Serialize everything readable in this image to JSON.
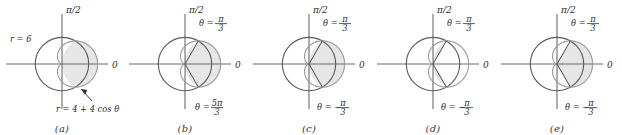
{
  "figure": {
    "colors": {
      "circle_stroke": "#5d5d5d",
      "cardioid_stroke": "#9a9a9a",
      "axis_stroke": "#6b6b6b",
      "ray_stroke": "#4a4a4a",
      "shade_fill": "#e6e6e6",
      "text": "#2e2e2e",
      "background": "#ffffff"
    },
    "axis_labels": {
      "vertical": "π/2",
      "horizontal": "0"
    },
    "panels": [
      {
        "caption": "(a)",
        "labels": [
          {
            "name": "circle-equation-label",
            "text": "r = 6",
            "x": 10,
            "y": 38
          },
          {
            "name": "cardioid-equation-label",
            "text": "r = 4 + 4 cos θ",
            "x": 56,
            "y": 108
          }
        ],
        "rays": [],
        "has_leader_arrow": true,
        "shaded_region": "crescent between circle r=6 and cardioid on the right"
      },
      {
        "caption": "(b)",
        "labels": [
          {
            "name": "theta-upper-label",
            "text": "θ = π/3",
            "x": 76,
            "y": 22
          },
          {
            "name": "theta-lower-label",
            "text": "θ = 5π/3",
            "x": 72,
            "y": 106
          }
        ],
        "rays": [
          60,
          -60
        ],
        "has_leader_arrow": false,
        "shaded_region": "crescent between circle r=6 and cardioid on the right"
      },
      {
        "caption": "(c)",
        "labels": [
          {
            "name": "theta-upper-label",
            "text": "θ = π/3",
            "x": 76,
            "y": 22
          },
          {
            "name": "theta-lower-label",
            "text": "θ = −π/3",
            "x": 70,
            "y": 106
          }
        ],
        "rays": [
          60,
          -60
        ],
        "has_leader_arrow": false,
        "shaded_region": "crescent between circle r=6 and cardioid on the right"
      },
      {
        "caption": "(d)",
        "labels": [
          {
            "name": "theta-upper-label",
            "text": "θ = π/3",
            "x": 76,
            "y": 22
          },
          {
            "name": "theta-lower-label",
            "text": "θ = −π/3",
            "x": 70,
            "y": 106
          }
        ],
        "rays": [
          60,
          -60
        ],
        "has_leader_arrow": false,
        "shaded_region": "circular sector of r=6 between -pi/3 and pi/3"
      },
      {
        "caption": "(e)",
        "labels": [
          {
            "name": "theta-upper-label",
            "text": "θ = π/3",
            "x": 76,
            "y": 22
          },
          {
            "name": "theta-lower-label",
            "text": "θ = −π/3",
            "x": 70,
            "y": 106
          }
        ],
        "rays": [
          60,
          -60
        ],
        "has_leader_arrow": false,
        "shaded_region": "cardioid wedge between -pi/3 and pi/3"
      }
    ],
    "chart_data": {
      "type": "line",
      "title": "Polar curves r = 6 and r = 4 + 4 cos θ",
      "xlabel": "",
      "ylabel": "",
      "curves": [
        {
          "name": "circle",
          "equation": "r = 6",
          "radius": 6,
          "center_polar": [
            0,
            0
          ]
        },
        {
          "name": "cardioid",
          "equation": "r = 4 + 4 cos θ",
          "a": 4,
          "b": 4
        }
      ],
      "intersection_angles_deg": [
        60,
        -60
      ],
      "intersection_angles_text": [
        "π/3",
        "5π/3",
        "−π/3"
      ],
      "legend": "none",
      "grid": false
    }
  }
}
